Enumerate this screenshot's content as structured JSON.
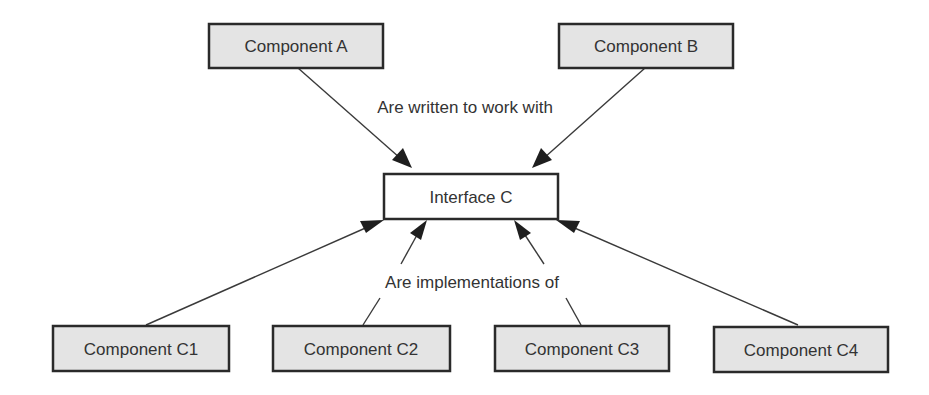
{
  "diagram": {
    "type": "interface-implementation",
    "nodes": {
      "component_a": {
        "label": "Component A",
        "style": "shaded"
      },
      "component_b": {
        "label": "Component B",
        "style": "shaded"
      },
      "interface_c": {
        "label": "Interface C",
        "style": "plain"
      },
      "component_c1": {
        "label": "Component C1",
        "style": "shaded"
      },
      "component_c2": {
        "label": "Component C2",
        "style": "shaded"
      },
      "component_c3": {
        "label": "Component C3",
        "style": "shaded"
      },
      "component_c4": {
        "label": "Component C4",
        "style": "shaded"
      }
    },
    "edge_labels": {
      "uses": "Are written to work with",
      "implements": "Are implementations of"
    },
    "edges": [
      {
        "from": "component_a",
        "to": "interface_c",
        "relation": "uses"
      },
      {
        "from": "component_b",
        "to": "interface_c",
        "relation": "uses"
      },
      {
        "from": "component_c1",
        "to": "interface_c",
        "relation": "implements"
      },
      {
        "from": "component_c2",
        "to": "interface_c",
        "relation": "implements"
      },
      {
        "from": "component_c3",
        "to": "interface_c",
        "relation": "implements"
      },
      {
        "from": "component_c4",
        "to": "interface_c",
        "relation": "implements"
      }
    ]
  }
}
